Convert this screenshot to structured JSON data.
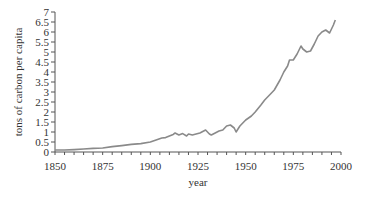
{
  "chart_data": {
    "type": "line",
    "title": "",
    "xlabel": "year",
    "ylabel": "tons of carbon per capita",
    "xlim": [
      1850,
      2000
    ],
    "ylim": [
      0,
      7
    ],
    "grid": false,
    "legend": null,
    "x_ticks": [
      1850,
      1875,
      1900,
      1925,
      1950,
      1975,
      2000
    ],
    "y_ticks": [
      "0",
      "0.5",
      "1",
      "1.5",
      "2",
      "2.5",
      "3",
      "3.5",
      "4",
      "4.5",
      "5",
      "5.5",
      "6",
      "6.5",
      "7"
    ],
    "line_color": "#8a8a8a",
    "series": [
      {
        "name": "carbon per capita",
        "x": [
          1850,
          1855,
          1860,
          1865,
          1870,
          1875,
          1880,
          1885,
          1890,
          1895,
          1900,
          1903,
          1906,
          1908,
          1910,
          1912,
          1913,
          1915,
          1917,
          1919,
          1920,
          1922,
          1924,
          1926,
          1928,
          1929,
          1931,
          1932,
          1934,
          1936,
          1938,
          1940,
          1942,
          1944,
          1945,
          1947,
          1950,
          1953,
          1955,
          1958,
          1960,
          1963,
          1965,
          1968,
          1970,
          1972,
          1973,
          1975,
          1977,
          1979,
          1980,
          1982,
          1984,
          1986,
          1988,
          1990,
          1992,
          1994,
          1996,
          1997
        ],
        "values": [
          0.1,
          0.1,
          0.12,
          0.15,
          0.18,
          0.2,
          0.27,
          0.32,
          0.38,
          0.42,
          0.5,
          0.6,
          0.7,
          0.72,
          0.8,
          0.88,
          0.95,
          0.85,
          0.92,
          0.8,
          0.9,
          0.85,
          0.9,
          0.95,
          1.05,
          1.1,
          0.9,
          0.85,
          0.95,
          1.05,
          1.1,
          1.3,
          1.35,
          1.2,
          1.0,
          1.3,
          1.6,
          1.8,
          2.0,
          2.35,
          2.6,
          2.9,
          3.1,
          3.6,
          4.0,
          4.3,
          4.6,
          4.6,
          4.9,
          5.3,
          5.15,
          5.0,
          5.05,
          5.4,
          5.8,
          6.0,
          6.1,
          5.95,
          6.35,
          6.6
        ]
      }
    ]
  },
  "plot_area": {
    "x0": 55,
    "x1": 341,
    "y0": 152,
    "y1": 12
  }
}
